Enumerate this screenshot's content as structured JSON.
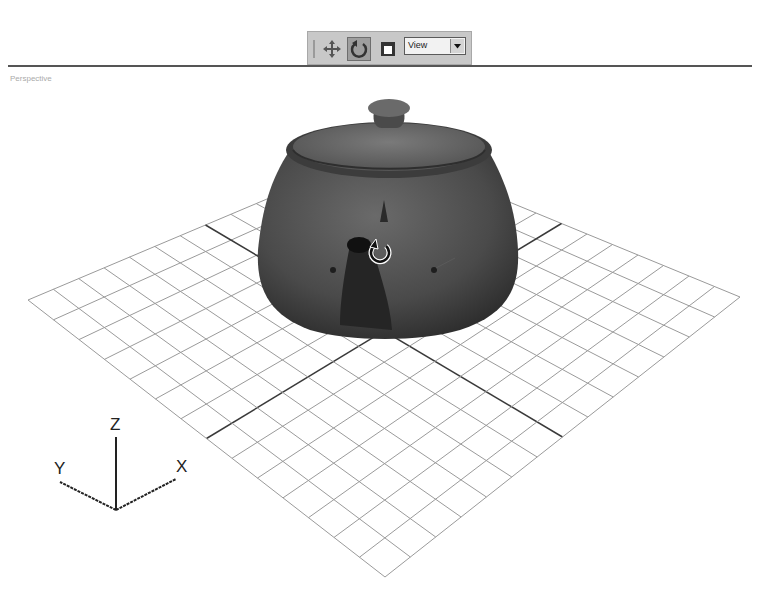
{
  "toolbar": {
    "tools": [
      {
        "name": "move-tool",
        "label": "Move"
      },
      {
        "name": "rotate-tool",
        "label": "Rotate",
        "active": true
      },
      {
        "name": "display-tool",
        "label": "Display"
      }
    ],
    "coordinate_system": {
      "selected": "View"
    }
  },
  "viewport": {
    "label": "Perspective",
    "object": "Teapot",
    "grid": {
      "divisions": 14,
      "line_color": "#9a9a9a",
      "axis_color": "#3a3a3a"
    }
  },
  "axis_tripod": {
    "x": "X",
    "y": "Y",
    "z": "Z"
  },
  "colors": {
    "teapot": "#4a4a4a",
    "toolbar_bg": "#c8c8c8",
    "active_button": "#9e9e9e"
  }
}
